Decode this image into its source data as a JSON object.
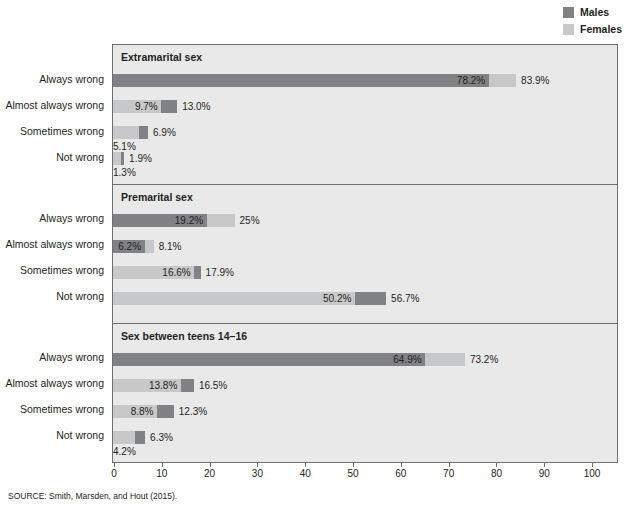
{
  "legend": {
    "items": [
      {
        "label": "Males",
        "color": "#808285",
        "icon": "square-swatch-icon"
      },
      {
        "label": "Females",
        "color": "#c7c8ca",
        "icon": "square-swatch-icon"
      }
    ]
  },
  "source": {
    "text": "SOURCE: Smith, Marsden, and Hout (2015)."
  },
  "clipped_title": {
    "text": ""
  },
  "chart_data": {
    "type": "bar",
    "title": "",
    "xlabel": "",
    "ylabel": "",
    "xlim": [
      0,
      105
    ],
    "xticks": [
      0,
      10,
      20,
      30,
      40,
      50,
      60,
      70,
      80,
      90,
      100
    ],
    "xtick_labels": [
      "0",
      "10",
      "20",
      "30",
      "40",
      "50",
      "60",
      "70",
      "80",
      "90",
      "100"
    ],
    "grid": false,
    "orientation": "horizontal",
    "legend_position": "top-right",
    "categories": [
      "Always wrong",
      "Almost always wrong",
      "Sometimes wrong",
      "Not wrong"
    ],
    "series": [
      {
        "name": "Males",
        "color": "#808285"
      },
      {
        "name": "Females",
        "color": "#c7c8ca"
      }
    ],
    "panels": [
      {
        "title": "Extramarital sex",
        "rows": [
          {
            "category": "Always wrong",
            "males": 78.2,
            "females": 83.9,
            "males_label": "78.2%",
            "females_label": "83.9%"
          },
          {
            "category": "Almost always wrong",
            "males": 13.0,
            "females": 9.7,
            "males_label": "13.0%",
            "females_label": "9.7%"
          },
          {
            "category": "Sometimes wrong",
            "males": 6.9,
            "females": 5.1,
            "males_label": "6.9%",
            "females_label": "5.1%"
          },
          {
            "category": "Not wrong",
            "males": 1.9,
            "females": 1.3,
            "males_label": "1.9%",
            "females_label": "1.3%"
          }
        ]
      },
      {
        "title": "Premarital sex",
        "rows": [
          {
            "category": "Always wrong",
            "males": 19.2,
            "females": 25.0,
            "males_label": "19.2%",
            "females_label": "25%"
          },
          {
            "category": "Almost always wrong",
            "males": 6.2,
            "females": 8.1,
            "males_label": "6.2%",
            "females_label": "8.1%"
          },
          {
            "category": "Sometimes wrong",
            "males": 17.9,
            "females": 16.6,
            "males_label": "17.9%",
            "females_label": "16.6%"
          },
          {
            "category": "Not wrong",
            "males": 56.7,
            "females": 50.2,
            "males_label": "56.7%",
            "females_label": "50.2%"
          }
        ]
      },
      {
        "title": "Sex between teens 14–16",
        "rows": [
          {
            "category": "Always wrong",
            "males": 64.9,
            "females": 73.2,
            "males_label": "64.9%",
            "females_label": "73.2%"
          },
          {
            "category": "Almost always wrong",
            "males": 16.5,
            "females": 13.8,
            "males_label": "16.5%",
            "females_label": "13.8%"
          },
          {
            "category": "Sometimes wrong",
            "males": 12.3,
            "females": 8.8,
            "males_label": "12.3%",
            "females_label": "8.8%"
          },
          {
            "category": "Not wrong",
            "males": 6.3,
            "females": 4.2,
            "males_label": "6.3%",
            "females_label": "4.2%"
          }
        ]
      }
    ]
  }
}
